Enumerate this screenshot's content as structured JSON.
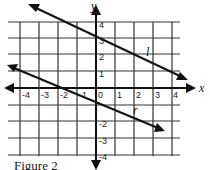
{
  "figure": {
    "caption": "Figure 2",
    "x_axis_label": "x",
    "y_axis_label": "y",
    "x_ticks": [
      "-4",
      "-3",
      "-2",
      "-1",
      "0",
      "1",
      "2",
      "3",
      "4"
    ],
    "y_ticks": [
      "4",
      "3",
      "2",
      "1",
      "-2",
      "-3",
      "-4"
    ],
    "lines": [
      {
        "name": "l",
        "label": "l",
        "slope": -0.5,
        "y_intercept": 3
      },
      {
        "name": "r",
        "label": "r",
        "slope": -0.5,
        "y_intercept": -1
      }
    ],
    "colors": {
      "grid": "#222222",
      "line": "#111111",
      "background": "#ffffff"
    }
  }
}
